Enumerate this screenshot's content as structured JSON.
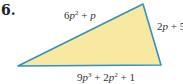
{
  "problem": {
    "number": "6."
  },
  "figure": {
    "shape": "triangle",
    "fill_color": "#f7e9a1",
    "stroke_color": "#3b8fb5",
    "vertices": [
      [
        18,
        66
      ],
      [
        143,
        4
      ],
      [
        161,
        65
      ]
    ],
    "sides": {
      "top": {
        "coef": "6",
        "var": "p",
        "exp": "2",
        "rest": " + ",
        "rest_var": "p",
        "full": "6p^2 + p"
      },
      "right": {
        "coef": "2",
        "var": "p",
        "rest": " + 5",
        "full": "2p + 5"
      },
      "bottom": {
        "coef": "9",
        "var": "p",
        "exp": "3",
        "mid": " + 2",
        "var2": "p",
        "exp2": "2",
        "rest": " + 1",
        "full": "9p^3 + 2p^2 + 1"
      }
    }
  }
}
